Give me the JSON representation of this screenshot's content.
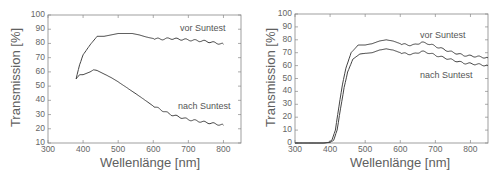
{
  "chart_data": [
    {
      "type": "line",
      "title": "",
      "xlabel": "Wellenlänge [nm]",
      "ylabel": "Transmission [%]",
      "xlim": [
        300,
        850
      ],
      "ylim": [
        10,
        100
      ],
      "xticks": [
        "300",
        "400",
        "500",
        "600",
        "700",
        "800"
      ],
      "yticks": [
        "10",
        "20",
        "30",
        "40",
        "50",
        "60",
        "70",
        "80",
        "90",
        "100"
      ],
      "grid": false,
      "legend": "inline annotations",
      "annotations": [
        "vor Suntest",
        "nach Suntest"
      ],
      "series": [
        {
          "name": "vor Suntest",
          "x": [
            380,
            390,
            400,
            420,
            440,
            460,
            480,
            500,
            520,
            540,
            560,
            580,
            600,
            620,
            650,
            700,
            750,
            800
          ],
          "y": [
            55,
            65,
            72,
            79,
            85,
            85,
            86,
            87,
            87,
            87,
            86,
            84.5,
            83.5,
            83,
            83.5,
            82.5,
            81.5,
            79.5
          ]
        },
        {
          "name": "nach Suntest",
          "x": [
            380,
            390,
            400,
            420,
            430,
            440,
            460,
            480,
            500,
            530,
            560,
            600,
            650,
            700,
            750,
            800
          ],
          "y": [
            55,
            58,
            58,
            60,
            61.5,
            61,
            58.5,
            56,
            53,
            48,
            43,
            36,
            30,
            26.5,
            24.5,
            22.5
          ]
        }
      ]
    },
    {
      "type": "line",
      "title": "",
      "xlabel": "Wellenlänge [nm]",
      "ylabel": "Transmission [%]",
      "xlim": [
        300,
        850
      ],
      "ylim": [
        0,
        100
      ],
      "xticks": [
        "300",
        "400",
        "500",
        "600",
        "700",
        "800"
      ],
      "yticks": [
        "0",
        "10",
        "20",
        "30",
        "40",
        "50",
        "60",
        "70",
        "80",
        "90",
        "100"
      ],
      "grid": false,
      "legend": "inline annotations",
      "annotations": [
        "vor Suntest",
        "nach Suntest"
      ],
      "series": [
        {
          "name": "vor Suntest",
          "x": [
            300,
            380,
            395,
            405,
            415,
            425,
            435,
            445,
            460,
            480,
            500,
            520,
            540,
            560,
            580,
            600,
            620,
            640,
            660,
            680,
            700,
            740,
            780,
            820,
            850
          ],
          "y": [
            0,
            0,
            0.5,
            2,
            10,
            28,
            45,
            58,
            70,
            76,
            76,
            77,
            79,
            80,
            79,
            77,
            76,
            76,
            78,
            77,
            75,
            71,
            68,
            67,
            66
          ]
        },
        {
          "name": "nach Suntest",
          "x": [
            300,
            385,
            400,
            410,
            420,
            430,
            440,
            450,
            465,
            485,
            500,
            520,
            540,
            560,
            580,
            600,
            620,
            640,
            660,
            680,
            700,
            740,
            780,
            820,
            850
          ],
          "y": [
            0,
            0,
            0.5,
            2,
            10,
            27,
            43,
            55,
            65,
            69,
            69.5,
            70,
            72,
            73,
            72,
            70,
            69,
            69,
            71,
            70,
            68,
            65,
            62,
            61,
            60
          ]
        }
      ]
    }
  ],
  "charts": [
    {
      "ylabel": "Transmission [%]",
      "xlabel": "Wellenlänge [nm]",
      "xticks": [
        "300",
        "400",
        "500",
        "600",
        "700",
        "800"
      ],
      "yticks": [
        "10",
        "20",
        "30",
        "40",
        "50",
        "60",
        "70",
        "80",
        "90",
        "100"
      ],
      "ann_vor": "vor Suntest",
      "ann_nach": "nach Suntest"
    },
    {
      "ylabel": "Transmission [%]",
      "xlabel": "Wellenlänge [nm]",
      "xticks": [
        "300",
        "400",
        "500",
        "600",
        "700",
        "800"
      ],
      "yticks": [
        "0",
        "10",
        "20",
        "30",
        "40",
        "50",
        "60",
        "70",
        "80",
        "90",
        "100"
      ],
      "ann_vor": "vor Suntest",
      "ann_nach": "nach Suntest"
    }
  ],
  "colors": {
    "line": "#444444",
    "axis": "#888888",
    "text": "#606060"
  }
}
